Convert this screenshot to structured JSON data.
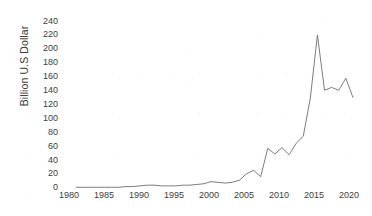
{
  "chart_data": {
    "type": "line",
    "title": "",
    "xlabel": "",
    "ylabel": "Billion U.S Dollar",
    "xlim": [
      1980,
      2022
    ],
    "ylim": [
      0,
      240
    ],
    "grid": false,
    "legend": null,
    "line_color": "#6e6e6e",
    "xticks": [
      1980,
      1985,
      1990,
      1995,
      2000,
      2005,
      2010,
      2015,
      2020
    ],
    "yticks": [
      0,
      20,
      40,
      60,
      80,
      100,
      120,
      140,
      160,
      180,
      200,
      220,
      240
    ],
    "x": [
      1982,
      1983,
      1984,
      1985,
      1986,
      1987,
      1988,
      1989,
      1990,
      1991,
      1992,
      1993,
      1994,
      1995,
      1996,
      1997,
      1998,
      1999,
      2000,
      2001,
      2002,
      2003,
      2004,
      2005,
      2006,
      2007,
      2008,
      2009,
      2010,
      2011,
      2012,
      2013,
      2014,
      2015,
      2016,
      2017,
      2018,
      2019,
      2020,
      2021
    ],
    "values": [
      1,
      1,
      1,
      1,
      1,
      1,
      1,
      2,
      2,
      3,
      4,
      4,
      3,
      3,
      3,
      4,
      4,
      5,
      6,
      9,
      8,
      7,
      8,
      11,
      20,
      25,
      16,
      56,
      48,
      57,
      47,
      63,
      73,
      127,
      216,
      138,
      142,
      138,
      155,
      128
    ],
    "series": [
      {
        "name": "Billion U.S Dollar",
        "values": [
          1,
          1,
          1,
          1,
          1,
          1,
          1,
          2,
          2,
          3,
          4,
          4,
          3,
          3,
          3,
          4,
          4,
          5,
          6,
          9,
          8,
          7,
          8,
          11,
          20,
          25,
          16,
          56,
          48,
          57,
          47,
          63,
          73,
          127,
          216,
          138,
          142,
          138,
          155,
          128
        ]
      }
    ]
  },
  "axes": {
    "y_label": "Billion U.S Dollar",
    "y_ticks": [
      "240",
      "220",
      "200",
      "180",
      "160",
      "140",
      "120",
      "100",
      "80",
      "60",
      "40",
      "20",
      "0"
    ],
    "x_ticks": [
      "1980",
      "1985",
      "1990",
      "1995",
      "2000",
      "2005",
      "2010",
      "2015",
      "2020"
    ]
  }
}
